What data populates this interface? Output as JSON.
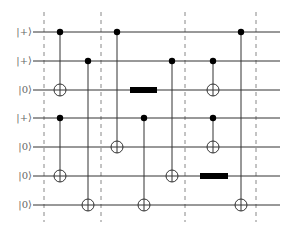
{
  "diagram": {
    "type": "quantum-circuit",
    "qubits": [
      {
        "label": "|+⟩",
        "y": 32
      },
      {
        "label": "|+⟩",
        "y": 61
      },
      {
        "label": "|0⟩",
        "y": 90
      },
      {
        "label": "|+⟩",
        "y": 118
      },
      {
        "label": "|0⟩",
        "y": 147
      },
      {
        "label": "|0⟩",
        "y": 176
      },
      {
        "label": "|0⟩",
        "y": 205
      }
    ],
    "barriers_x": [
      44,
      101,
      185,
      256
    ],
    "cnots": [
      {
        "x": 60,
        "control": 0,
        "target": 2
      },
      {
        "x": 60,
        "control": 3,
        "target": 5
      },
      {
        "x": 88,
        "control": 1,
        "target": 6
      },
      {
        "x": 117,
        "control": 0,
        "target": 4
      },
      {
        "x": 144,
        "control": 3,
        "target": 6
      },
      {
        "x": 172,
        "control": 1,
        "target": 5
      },
      {
        "x": 213,
        "control": 1,
        "target": 2
      },
      {
        "x": 213,
        "control": 3,
        "target": 4
      },
      {
        "x": 241,
        "control": 0,
        "target": 6
      }
    ],
    "boxes": [
      {
        "qubit": 2,
        "x": 130,
        "width": 27
      },
      {
        "qubit": 5,
        "x": 200,
        "width": 28
      }
    ],
    "colors": {
      "wire": "#333333",
      "barrier": "#888888",
      "gate": "#000000",
      "label": "#666666"
    }
  }
}
